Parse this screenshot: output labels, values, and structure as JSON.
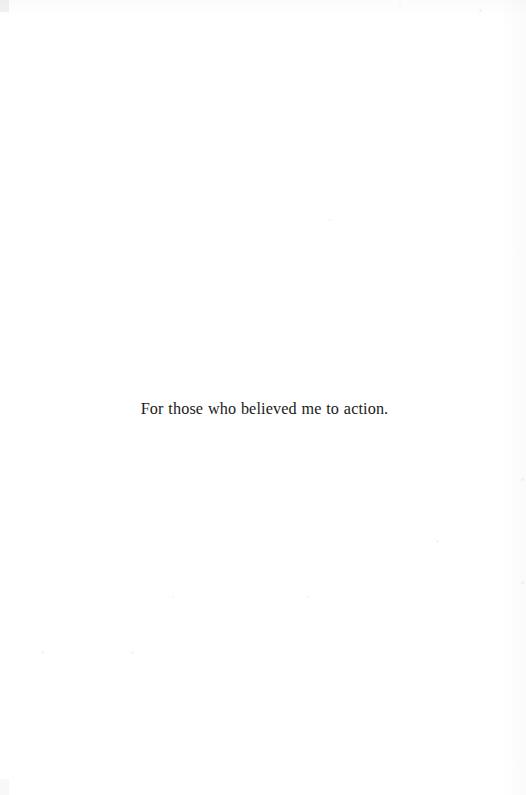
{
  "page": {
    "kind": "book-dedication-page",
    "background_color": "#ffffff",
    "width": 526,
    "height": 795
  },
  "dedication": {
    "text": "For those who believed me to action.",
    "text_color": "#1b1b20",
    "alignment": "center"
  },
  "artifacts": {
    "specks": [
      {
        "x": 41,
        "y": 651,
        "size": 3
      },
      {
        "x": 131,
        "y": 651,
        "size": 3
      },
      {
        "x": 436,
        "y": 540,
        "size": 3
      },
      {
        "x": 307,
        "y": 596,
        "size": 2
      },
      {
        "x": 172,
        "y": 596,
        "size": 2
      },
      {
        "x": 479,
        "y": 9,
        "size": 3
      },
      {
        "x": 399,
        "y": 4,
        "size": 2
      },
      {
        "x": 521,
        "y": 478,
        "size": 3
      },
      {
        "x": 521,
        "y": 581,
        "size": 3
      },
      {
        "x": 329,
        "y": 219,
        "size": 2
      }
    ]
  }
}
